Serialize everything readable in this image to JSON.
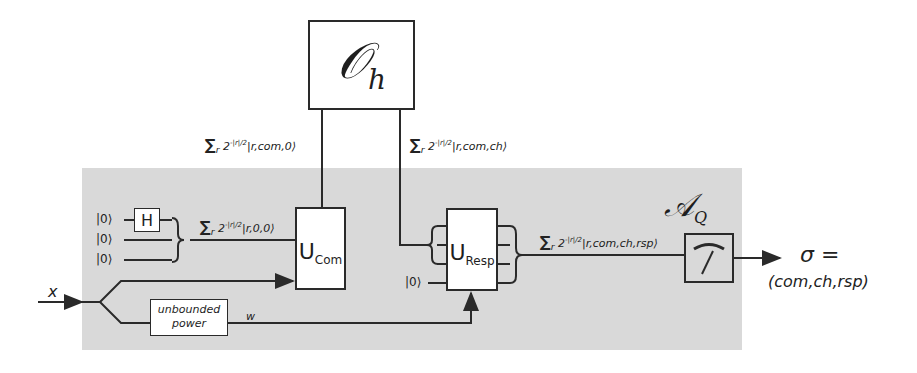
{
  "diagram": {
    "oracle": {
      "symbol": "𝒪",
      "subscript": "h"
    },
    "region": {
      "symbol": "𝒜",
      "subscript": "Q",
      "fill": "#d9d9d9"
    },
    "inputs": {
      "qubits": [
        "|0⟩",
        "|0⟩",
        "|0⟩"
      ],
      "hadamard": "H",
      "x_label": "x",
      "resp_ancilla": "|0⟩"
    },
    "states": {
      "after_h": {
        "sigma": "∑",
        "index": "r",
        "coeff": "2",
        "exp": "-|r|/2",
        "ket": "|r,0,0⟩"
      },
      "to_oracle": {
        "sigma": "∑",
        "index": "r",
        "coeff": "2",
        "exp": "-|r|/2",
        "ket": "|r,com,0⟩"
      },
      "from_oracle": {
        "sigma": "∑",
        "index": "r",
        "coeff": "2",
        "exp": "-|r|/2",
        "ket": "|r,com,ch⟩"
      },
      "after_resp": {
        "sigma": "∑",
        "index": "r",
        "coeff": "2",
        "exp": "-|r|/2",
        "ket": "|r,com,ch,rsp⟩"
      }
    },
    "gates": {
      "u_com": {
        "main": "U",
        "sub": "Com"
      },
      "u_resp": {
        "main": "U",
        "sub": "Resp"
      },
      "power": {
        "line1": "unbounded",
        "line2": "power"
      },
      "w_label": "w"
    },
    "output": {
      "sigma_line": "σ =",
      "tuple": "(com,ch,rsp)"
    }
  }
}
